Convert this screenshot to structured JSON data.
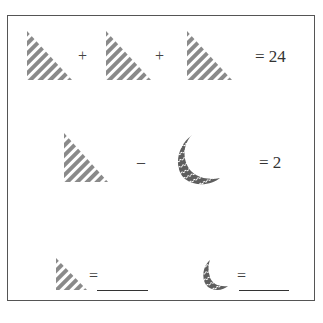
{
  "puzzle": {
    "rows": [
      {
        "shapes": [
          "triangle",
          "triangle",
          "triangle"
        ],
        "operators": [
          "+",
          "+"
        ],
        "result": "= 24"
      },
      {
        "shapes": [
          "triangle",
          "crescent"
        ],
        "operators": [
          "–"
        ],
        "result": "= 2"
      }
    ],
    "answers": [
      {
        "shape": "triangle",
        "equals": "=",
        "blank": ""
      },
      {
        "shape": "crescent",
        "equals": "=",
        "blank": ""
      }
    ]
  },
  "colors": {
    "shape_fill": "#8a8a8a",
    "crescent_fill": "#5e5e5e",
    "stripe_bg": "#ffffff",
    "border": "#555555",
    "text": "#333333"
  }
}
